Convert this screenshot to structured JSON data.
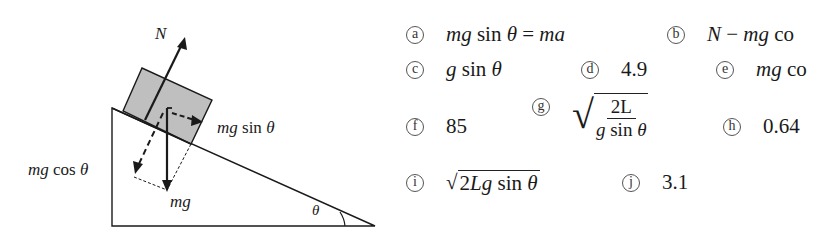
{
  "diagram": {
    "labels": {
      "normal": "N",
      "weight": "mg",
      "parallel": "mg sin θ",
      "perpendicular": "mg cos θ",
      "angle": "θ"
    },
    "colors": {
      "block_fill": "#bfbfbf",
      "line": "#1a1a1a"
    }
  },
  "options": [
    {
      "id": "a",
      "label": "mg sin θ = ma"
    },
    {
      "id": "b",
      "label": "N − mg co"
    },
    {
      "id": "c",
      "label": "g sin θ"
    },
    {
      "id": "d",
      "label": "4.9"
    },
    {
      "id": "e",
      "label": "mg co"
    },
    {
      "id": "f",
      "label": "85"
    },
    {
      "id": "g",
      "label_num": "2L",
      "label_den": "g sin θ",
      "label": "√(2L / g sin θ)"
    },
    {
      "id": "h",
      "label": "0.64"
    },
    {
      "id": "i",
      "label": "√(2Lg sin θ)",
      "radicand": "2Lg sin θ"
    },
    {
      "id": "j",
      "label": "3.1"
    }
  ]
}
